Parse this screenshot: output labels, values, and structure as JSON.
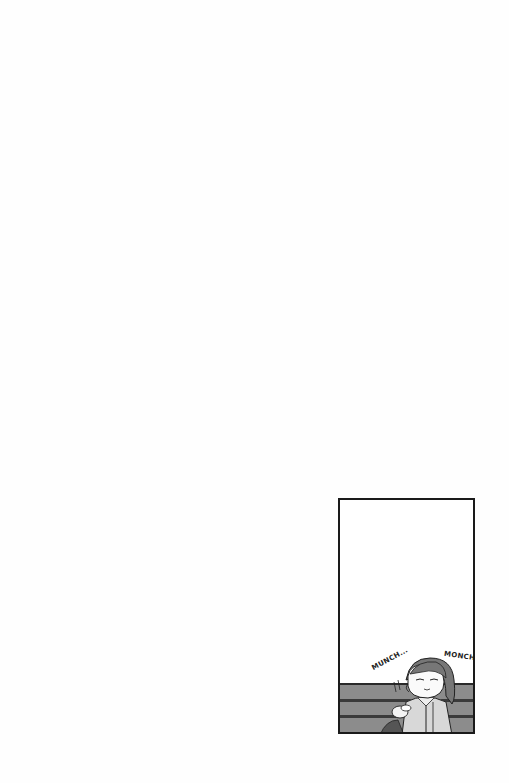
{
  "page": {
    "background": "#fefefe"
  },
  "panel": {
    "border_color": "#1a1a1a",
    "bench_color": "#8c8c8c",
    "sound_effects": [
      {
        "text": "MUNCH...",
        "position": "left"
      },
      {
        "text": "MONCH",
        "position": "right"
      }
    ],
    "scene": "character-eating-on-bench"
  }
}
